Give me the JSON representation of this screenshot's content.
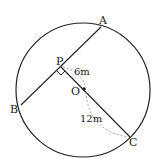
{
  "diagram": {
    "labels": {
      "A": "A",
      "B": "B",
      "P": "P",
      "O": "O",
      "C": "C"
    },
    "measurements": {
      "PO": "6m",
      "OC": "12m"
    },
    "colors": {
      "line": "#222222",
      "dashed": "#888888"
    }
  }
}
